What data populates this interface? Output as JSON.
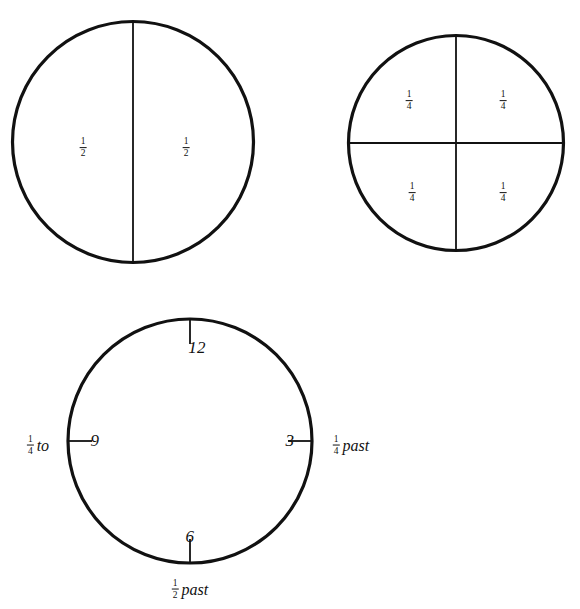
{
  "figure": {
    "background_color": "#ffffff",
    "stroke_color": "#111111"
  },
  "circles": [
    {
      "name": "half-circle",
      "divisions": 2,
      "cx": 133,
      "cy": 142,
      "r": 121,
      "labels": [
        {
          "numerator": "1",
          "denominator": "2",
          "x": 83,
          "y": 143
        },
        {
          "numerator": "1",
          "denominator": "2",
          "x": 186,
          "y": 143
        }
      ]
    },
    {
      "name": "quarter-circle",
      "divisions": 4,
      "cx": 456,
      "cy": 143,
      "r": 108,
      "labels": [
        {
          "numerator": "1",
          "denominator": "4",
          "x": 409,
          "y": 96
        },
        {
          "numerator": "1",
          "denominator": "4",
          "x": 503,
          "y": 96
        },
        {
          "numerator": "1",
          "denominator": "4",
          "x": 412,
          "y": 188
        },
        {
          "numerator": "1",
          "denominator": "4",
          "x": 503,
          "y": 188
        }
      ]
    }
  ],
  "clock": {
    "name": "clock-face",
    "cx": 190,
    "cy": 441,
    "r": 123,
    "ticks": [
      {
        "name": "tick-12",
        "position": "top"
      },
      {
        "name": "tick-3",
        "position": "right"
      },
      {
        "name": "tick-6",
        "position": "bottom"
      },
      {
        "name": "tick-9",
        "position": "left"
      }
    ],
    "numbers": [
      {
        "name": "clock-number-12",
        "text": "12",
        "x": 197,
        "y": 348
      },
      {
        "name": "clock-number-3",
        "text": "3",
        "x": 290,
        "y": 441
      },
      {
        "name": "clock-number-6",
        "text": "6",
        "x": 190,
        "y": 537
      },
      {
        "name": "clock-number-9",
        "text": "9",
        "x": 95,
        "y": 441
      }
    ],
    "annotations": [
      {
        "name": "quarter-to-label",
        "numerator": "1",
        "denominator": "4",
        "word": "to",
        "order": "fraction-first",
        "x": 38,
        "y": 442
      },
      {
        "name": "quarter-past-label",
        "numerator": "1",
        "denominator": "4",
        "word": "past",
        "order": "fraction-first",
        "x": 351,
        "y": 442
      },
      {
        "name": "half-past-label",
        "numerator": "1",
        "denominator": "2",
        "word": "past",
        "order": "fraction-first",
        "x": 190,
        "y": 586
      }
    ]
  }
}
